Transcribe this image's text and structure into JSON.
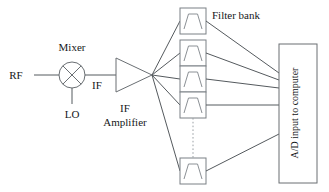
{
  "figure": {
    "line_color": "#555a5e",
    "box_color": "#6a6f73",
    "text_color": "#16181a",
    "background": "#ffffff"
  },
  "labels": {
    "rf": "RF",
    "mixer": "Mixer",
    "lo": "LO",
    "if_short": "IF",
    "if_amp_line1": "IF",
    "if_amp_line2": "Amplifier",
    "filter_bank": "Filter bank",
    "ad_input": "A/D input to computer"
  },
  "blocks": {
    "mixer": {
      "type": "mixer-circle-x",
      "cx": 72,
      "cy": 75,
      "r": 13
    },
    "amplifier": {
      "type": "triangle",
      "x1": 116,
      "y1": 58,
      "x2": 116,
      "y2": 92,
      "apex_x": 152,
      "apex_y": 75
    },
    "ad_converter": {
      "type": "rectangle",
      "x": 279,
      "y": 44,
      "width": 38,
      "height": 139
    }
  },
  "filters": [
    {
      "index": 1,
      "x": 180,
      "y": 8,
      "width": 26,
      "height": 26,
      "symbol": "bandpass-trapezoid"
    },
    {
      "index": 2,
      "x": 180,
      "y": 40,
      "width": 26,
      "height": 26,
      "symbol": "bandpass-trapezoid"
    },
    {
      "index": 3,
      "x": 180,
      "y": 66,
      "width": 26,
      "height": 26,
      "symbol": "bandpass-trapezoid"
    },
    {
      "index": 4,
      "x": 180,
      "y": 92,
      "width": 26,
      "height": 26,
      "symbol": "bandpass-trapezoid"
    },
    {
      "index": 5,
      "x": 180,
      "y": 158,
      "width": 26,
      "height": 26,
      "symbol": "bandpass-trapezoid"
    }
  ],
  "connections": {
    "rf_to_mixer": "RF input line into mixer",
    "lo_to_mixer": "Local oscillator line into mixer from below",
    "mixer_to_amp": "IF line from mixer to IF amplifier",
    "amp_fanout_count": 5,
    "filters_to_ad_count": 5,
    "continuation_indicator": "vertical dotted line between filter 4 and filter 5"
  }
}
